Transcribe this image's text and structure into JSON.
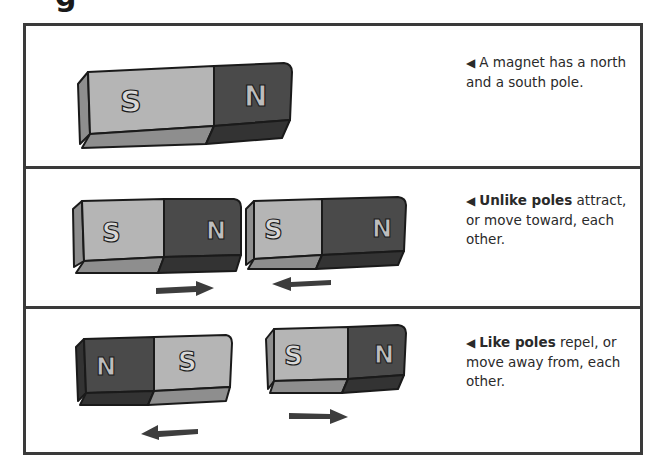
{
  "heading_fragment": "g",
  "colors": {
    "frame": "#3a3a3a",
    "south_face": "#b5b5b5",
    "south_side": "#8e8e8e",
    "north_face": "#4a4a4a",
    "north_side": "#333333",
    "outline": "#1a1a1a",
    "arrow": "#3d3d3d",
    "text": "#2a2a2a"
  },
  "panels": [
    {
      "id": "magnet-poles",
      "caption": {
        "bullet": "◀",
        "bold": "",
        "text": "A magnet has a north and a south pole."
      },
      "magnets": [
        {
          "left_label": "S",
          "right_label": "N"
        }
      ],
      "arrows": []
    },
    {
      "id": "unlike-poles",
      "caption": {
        "bullet": "◀",
        "bold": "Unlike poles",
        "text": " attract, or move toward, each other."
      },
      "magnets": [
        {
          "left_label": "S",
          "right_label": "N"
        },
        {
          "left_label": "S",
          "right_label": "N"
        }
      ],
      "arrows": [
        {
          "direction": "right"
        },
        {
          "direction": "left"
        }
      ]
    },
    {
      "id": "like-poles",
      "caption": {
        "bullet": "◀",
        "bold": "Like poles",
        "text": " repel, or move away from, each other."
      },
      "magnets": [
        {
          "left_label": "N",
          "right_label": "S"
        },
        {
          "left_label": "S",
          "right_label": "N"
        }
      ],
      "arrows": [
        {
          "direction": "left"
        },
        {
          "direction": "right"
        }
      ]
    }
  ]
}
